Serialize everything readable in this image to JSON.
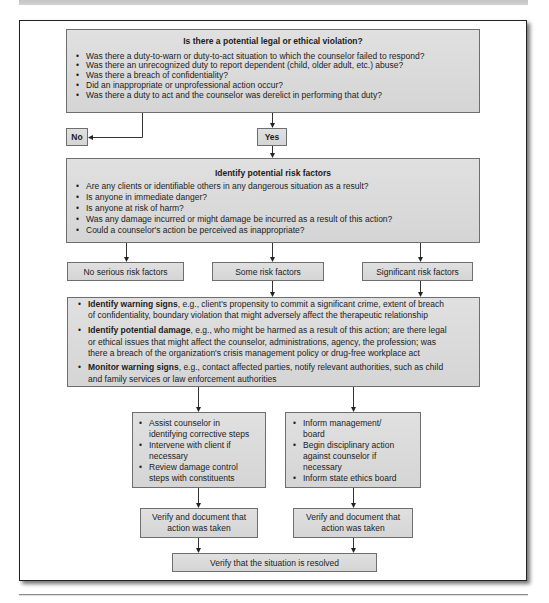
{
  "question": {
    "title": "Is there a potential legal or ethical violation?",
    "items": [
      "Was there a duty-to-warn or duty-to-act situation to which the counselor failed to respond?",
      "Was there an unrecognized duty to report dependent (child, older adult, etc.) abuse?",
      "Was there a breach of confidentiality?",
      "Did an inappropriate or unprofessional action occur?",
      "Was there a duty to act and the counselor was derelict in performing that duty?"
    ]
  },
  "decisions": {
    "no": "No",
    "yes": "Yes"
  },
  "risk": {
    "title": "Identify potential risk factors",
    "items": [
      "Are any clients or identifiable others in any dangerous situation as a result?",
      "Is anyone in immediate danger?",
      "Is anyone at risk of harm?",
      "Was any damage incurred or might damage be incurred as a result of this action?",
      "Could a counselor's action be perceived as inappropriate?"
    ]
  },
  "levels": {
    "none": "No serious risk factors",
    "some": "Some risk factors",
    "significant": "Significant risk factors"
  },
  "response": {
    "items": [
      {
        "lead": "Identify warning signs",
        "lines": [
          ", e.g., client's propensity to commit a significant crime, extent of breach",
          "of confidentiality, boundary violation that might adversely affect the therapeutic relationship"
        ]
      },
      {
        "lead": "Identify potential damage",
        "lines": [
          ", e.g., who might be harmed as a result of this action; are there legal",
          "or ethical issues that might affect the counselor, administrations, agency, the profession; was",
          "there a breach of the organization's crisis management policy or drug-free workplace act"
        ]
      },
      {
        "lead": "Monitor warning signs",
        "lines": [
          ", e.g., contact affected parties, notify relevant authorities, such as child",
          "and family services or law enforcement authorities"
        ]
      }
    ]
  },
  "corrective_steps": {
    "items": [
      {
        "lines": [
          "Assist counselor in",
          "identifying corrective steps"
        ]
      },
      {
        "lines": [
          "Intervene with client if",
          "necessary"
        ]
      },
      {
        "lines": [
          "Review damage control",
          "steps with constituents"
        ]
      }
    ]
  },
  "disciplinary_steps": {
    "items": [
      {
        "lines": [
          "Inform management/",
          "board"
        ]
      },
      {
        "lines": [
          "Begin disciplinary action",
          "against counselor if",
          "necessary"
        ]
      },
      {
        "lines": [
          "Inform state ethics board"
        ]
      }
    ]
  },
  "verify_left": {
    "lines": [
      "Verify and document that",
      "action was taken"
    ]
  },
  "verify_right": {
    "lines": [
      "Verify and document that",
      "action was taken"
    ]
  },
  "resolved": "Verify that the situation is resolved",
  "colors": {
    "box_fill": "#dcdcdc",
    "box_border": "#6e6e6e",
    "connector": "#333333",
    "frame_border": "#222222"
  }
}
